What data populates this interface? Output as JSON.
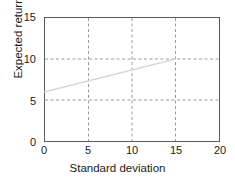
{
  "chart_data": {
    "type": "line",
    "title": "",
    "xlabel": "Standard deviation",
    "ylabel": "Expected return",
    "xlim": [
      0,
      20
    ],
    "ylim": [
      0,
      15
    ],
    "xticks": [
      0,
      5,
      10,
      15,
      20
    ],
    "yticks": [
      0,
      5,
      10,
      15
    ],
    "xtick_labels": [
      "0",
      "5",
      "10",
      "15",
      "20"
    ],
    "ytick_labels": [
      "0",
      "5",
      "10",
      "15"
    ],
    "grid": true,
    "grid_style": "dashed",
    "grid_color": "#9a9a9a",
    "legend": "none",
    "series": [
      {
        "name": "capital-market-line",
        "color": "#d8d8d8",
        "line_width": 1.4,
        "x": [
          0,
          15
        ],
        "values": [
          6,
          10
        ],
        "points": [
          {
            "x": 0,
            "y": 6
          },
          {
            "x": 15,
            "y": 10
          }
        ]
      }
    ],
    "frame_color": "#5a5a5a",
    "background": "#ffffff"
  }
}
